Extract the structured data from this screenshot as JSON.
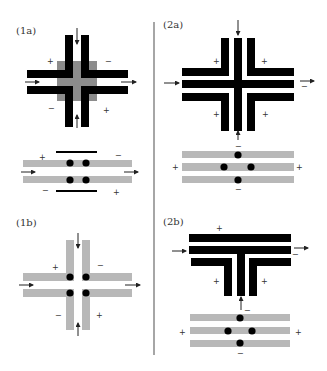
{
  "colors": {
    "black_bar": "#000000",
    "gray_bar": "#b8b8b8",
    "gray_square": "#8c8c8c",
    "dot": "#000000",
    "divider": "#888888",
    "text": "#333333"
  },
  "divider": {
    "x": 154,
    "y1": 22,
    "y2": 355
  },
  "panels": [
    {
      "id": "1a",
      "label": "(1a)",
      "label_pos": [
        16,
        34
      ],
      "rects": [
        {
          "x": 57,
          "y": 61,
          "w": 40,
          "h": 40,
          "fill": "gray_square"
        },
        {
          "x": 65,
          "y": 35,
          "w": 8,
          "h": 92,
          "fill": "black_bar"
        },
        {
          "x": 81,
          "y": 35,
          "w": 8,
          "h": 92,
          "fill": "black_bar"
        },
        {
          "x": 27,
          "y": 70,
          "w": 101,
          "h": 8,
          "fill": "black_bar"
        },
        {
          "x": 27,
          "y": 86,
          "w": 101,
          "h": 8,
          "fill": "black_bar"
        },
        {
          "x": 73,
          "y": 61,
          "w": 8,
          "h": 40,
          "fill": "gray_square"
        },
        {
          "x": 57,
          "y": 78,
          "w": 40,
          "h": 8,
          "fill": "gray_square"
        }
      ],
      "arrows": [
        {
          "x1": 77,
          "y1": 28,
          "x2": 77,
          "y2": 44,
          "dir": "down"
        },
        {
          "x1": 77,
          "y1": 128,
          "x2": 77,
          "y2": 115,
          "dir": "up"
        },
        {
          "x1": 25,
          "y1": 82,
          "x2": 39,
          "y2": 82,
          "dir": "right"
        },
        {
          "x1": 121,
          "y1": 82,
          "x2": 136,
          "y2": 82,
          "dir": "right"
        }
      ],
      "signs": [
        {
          "text": "+",
          "x": 47,
          "y": 64
        },
        {
          "text": "−",
          "x": 105,
          "y": 64
        },
        {
          "text": "−",
          "x": 48,
          "y": 111
        },
        {
          "text": "+",
          "x": 103,
          "y": 113
        }
      ]
    },
    {
      "id": "1a-lower",
      "label": "",
      "rects": [
        {
          "x": 56,
          "y": 151,
          "w": 41,
          "h": 2,
          "fill": "black_bar"
        },
        {
          "x": 23,
          "y": 160,
          "w": 109,
          "h": 7,
          "fill": "gray_bar"
        },
        {
          "x": 23,
          "y": 176,
          "w": 109,
          "h": 7,
          "fill": "gray_bar"
        },
        {
          "x": 56,
          "y": 190,
          "w": 41,
          "h": 2,
          "fill": "black_bar"
        }
      ],
      "dots": [
        {
          "cx": 70,
          "cy": 163,
          "r": 3.6
        },
        {
          "cx": 86,
          "cy": 163,
          "r": 3.6
        },
        {
          "cx": 70,
          "cy": 180,
          "r": 3.6
        },
        {
          "cx": 86,
          "cy": 180,
          "r": 3.6
        }
      ],
      "arrows": [
        {
          "x1": 21,
          "y1": 172,
          "x2": 35,
          "y2": 172,
          "dir": "right"
        },
        {
          "x1": 124,
          "y1": 172,
          "x2": 138,
          "y2": 172,
          "dir": "right"
        }
      ],
      "signs": [
        {
          "text": "+",
          "x": 39,
          "y": 160
        },
        {
          "text": "−",
          "x": 115,
          "y": 158
        },
        {
          "text": "−",
          "x": 42,
          "y": 193
        },
        {
          "text": "+",
          "x": 113,
          "y": 195
        }
      ]
    },
    {
      "id": "1b",
      "label": "(1b)",
      "label_pos": [
        16,
        226
      ],
      "rects": [
        {
          "x": 66,
          "y": 240,
          "w": 8,
          "h": 90,
          "fill": "gray_bar"
        },
        {
          "x": 82,
          "y": 240,
          "w": 8,
          "h": 90,
          "fill": "gray_bar"
        },
        {
          "x": 23,
          "y": 273,
          "w": 109,
          "h": 8,
          "fill": "gray_bar"
        },
        {
          "x": 23,
          "y": 289,
          "w": 109,
          "h": 8,
          "fill": "gray_bar"
        },
        {
          "x": 74,
          "y": 273,
          "w": 8,
          "h": 24,
          "fill": "white"
        },
        {
          "x": 66,
          "y": 281,
          "w": 24,
          "h": 8,
          "fill": "white"
        }
      ],
      "dots": [
        {
          "cx": 70,
          "cy": 277,
          "r": 3.6
        },
        {
          "cx": 86,
          "cy": 277,
          "r": 3.6
        },
        {
          "cx": 70,
          "cy": 293,
          "r": 3.6
        },
        {
          "cx": 86,
          "cy": 293,
          "r": 3.6
        }
      ],
      "arrows": [
        {
          "x1": 78,
          "y1": 233,
          "x2": 78,
          "y2": 248,
          "dir": "down"
        },
        {
          "x1": 78,
          "y1": 336,
          "x2": 78,
          "y2": 323,
          "dir": "up"
        },
        {
          "x1": 19,
          "y1": 285,
          "x2": 33,
          "y2": 285,
          "dir": "right"
        },
        {
          "x1": 125,
          "y1": 285,
          "x2": 140,
          "y2": 285,
          "dir": "right"
        }
      ],
      "signs": [
        {
          "text": "+",
          "x": 52,
          "y": 270
        },
        {
          "text": "−",
          "x": 97,
          "y": 268
        },
        {
          "text": "−",
          "x": 55,
          "y": 318
        },
        {
          "text": "+",
          "x": 96,
          "y": 318
        }
      ]
    },
    {
      "id": "2a",
      "label": "(2a)",
      "label_pos": [
        163,
        28
      ],
      "rects": [
        {
          "x": 182,
          "y": 68,
          "w": 47,
          "h": 8,
          "fill": "black_bar"
        },
        {
          "x": 221,
          "y": 38,
          "w": 8,
          "h": 38,
          "fill": "black_bar"
        },
        {
          "x": 247,
          "y": 68,
          "w": 47,
          "h": 8,
          "fill": "black_bar"
        },
        {
          "x": 247,
          "y": 38,
          "w": 8,
          "h": 38,
          "fill": "black_bar"
        },
        {
          "x": 182,
          "y": 80,
          "w": 112,
          "h": 8,
          "fill": "black_bar"
        },
        {
          "x": 234,
          "y": 38,
          "w": 8,
          "h": 93,
          "fill": "black_bar"
        },
        {
          "x": 182,
          "y": 93,
          "w": 47,
          "h": 8,
          "fill": "black_bar"
        },
        {
          "x": 221,
          "y": 93,
          "w": 8,
          "h": 38,
          "fill": "black_bar"
        },
        {
          "x": 247,
          "y": 93,
          "w": 47,
          "h": 8,
          "fill": "black_bar"
        },
        {
          "x": 247,
          "y": 93,
          "w": 8,
          "h": 38,
          "fill": "black_bar"
        }
      ],
      "arrows": [
        {
          "x1": 238,
          "y1": 20,
          "x2": 238,
          "y2": 35,
          "dir": "down"
        },
        {
          "x1": 238,
          "y1": 140,
          "x2": 238,
          "y2": 131,
          "dir": "up"
        },
        {
          "x1": 164,
          "y1": 83,
          "x2": 179,
          "y2": 83,
          "dir": "right"
        },
        {
          "x1": 300,
          "y1": 81,
          "x2": 314,
          "y2": 81,
          "dir": "right"
        }
      ],
      "signs": [
        {
          "text": "+",
          "x": 213,
          "y": 64
        },
        {
          "text": "+",
          "x": 261,
          "y": 64
        },
        {
          "text": "−",
          "x": 301,
          "y": 89
        },
        {
          "text": "+",
          "x": 213,
          "y": 117
        },
        {
          "text": "+",
          "x": 262,
          "y": 117
        }
      ]
    },
    {
      "id": "2a-lower",
      "label": "",
      "rects": [
        {
          "x": 182,
          "y": 151,
          "w": 112,
          "h": 7,
          "fill": "gray_bar"
        },
        {
          "x": 182,
          "y": 163,
          "w": 112,
          "h": 8,
          "fill": "gray_bar"
        },
        {
          "x": 182,
          "y": 176,
          "w": 112,
          "h": 7,
          "fill": "gray_bar"
        }
      ],
      "dots": [
        {
          "cx": 238,
          "cy": 155,
          "r": 3.6
        },
        {
          "cx": 224,
          "cy": 167,
          "r": 3.6
        },
        {
          "cx": 251,
          "cy": 167,
          "r": 3.6
        },
        {
          "cx": 238,
          "cy": 180,
          "r": 3.6
        }
      ],
      "signs": [
        {
          "text": "−",
          "x": 235,
          "y": 149
        },
        {
          "text": "+",
          "x": 172,
          "y": 170
        },
        {
          "text": "+",
          "x": 296,
          "y": 170
        },
        {
          "text": "−",
          "x": 235,
          "y": 192
        }
      ]
    },
    {
      "id": "2b",
      "label": "(2b)",
      "label_pos": [
        163,
        225
      ],
      "rects": [
        {
          "x": 189,
          "y": 234,
          "w": 102,
          "h": 8,
          "fill": "black_bar"
        },
        {
          "x": 189,
          "y": 246,
          "w": 102,
          "h": 8,
          "fill": "black_bar"
        },
        {
          "x": 237,
          "y": 246,
          "w": 8,
          "h": 50,
          "fill": "black_bar"
        },
        {
          "x": 191,
          "y": 258,
          "w": 41,
          "h": 8,
          "fill": "black_bar"
        },
        {
          "x": 224,
          "y": 258,
          "w": 8,
          "h": 38,
          "fill": "black_bar"
        },
        {
          "x": 249,
          "y": 258,
          "w": 42,
          "h": 8,
          "fill": "black_bar"
        },
        {
          "x": 249,
          "y": 258,
          "w": 8,
          "h": 38,
          "fill": "black_bar"
        }
      ],
      "arrows": [
        {
          "x1": 172,
          "y1": 251,
          "x2": 186,
          "y2": 251,
          "dir": "right"
        },
        {
          "x1": 294,
          "y1": 248,
          "x2": 308,
          "y2": 248,
          "dir": "right"
        },
        {
          "x1": 241,
          "y1": 310,
          "x2": 241,
          "y2": 297,
          "dir": "up"
        }
      ],
      "signs": [
        {
          "text": "+",
          "x": 216,
          "y": 231
        },
        {
          "text": "−",
          "x": 292,
          "y": 257
        },
        {
          "text": "+",
          "x": 213,
          "y": 284
        },
        {
          "text": "+",
          "x": 261,
          "y": 284
        },
        {
          "text": "−",
          "x": 244,
          "y": 313
        }
      ]
    },
    {
      "id": "2b-lower",
      "label": "",
      "rects": [
        {
          "x": 190,
          "y": 314,
          "w": 100,
          "h": 7,
          "fill": "gray_bar"
        },
        {
          "x": 190,
          "y": 327,
          "w": 100,
          "h": 7,
          "fill": "gray_bar"
        },
        {
          "x": 190,
          "y": 340,
          "w": 100,
          "h": 7,
          "fill": "gray_bar"
        }
      ],
      "dots": [
        {
          "cx": 240,
          "cy": 318,
          "r": 3.6
        },
        {
          "cx": 228,
          "cy": 331,
          "r": 3.6
        },
        {
          "cx": 252,
          "cy": 331,
          "r": 3.6
        },
        {
          "cx": 240,
          "cy": 343,
          "r": 3.6
        }
      ],
      "signs": [
        {
          "text": "+",
          "x": 179,
          "y": 335
        },
        {
          "text": "+",
          "x": 295,
          "y": 335
        },
        {
          "text": "−",
          "x": 237,
          "y": 356
        }
      ]
    }
  ]
}
